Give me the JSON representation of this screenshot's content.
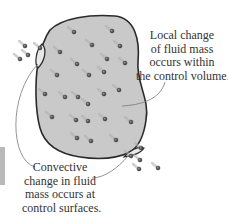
{
  "diagram": {
    "labels": {
      "local": [
        "Local change",
        "of fluid mass",
        "occurs within",
        "the control volume."
      ],
      "convective": [
        "Convective",
        "change in fluid",
        "mass occurs at",
        "control surfaces."
      ]
    },
    "colors": {
      "region_fill": "#c9c9c9",
      "outline": "#2a2a2a",
      "particle": "#555555",
      "leader_line": "#777777",
      "text": "#333333"
    },
    "particles": [
      [
        74,
        32
      ],
      [
        112,
        31
      ],
      [
        92,
        45
      ],
      [
        120,
        46
      ],
      [
        60,
        52
      ],
      [
        107,
        59
      ],
      [
        125,
        63
      ],
      [
        77,
        64
      ],
      [
        89,
        75
      ],
      [
        104,
        72
      ],
      [
        57,
        75
      ],
      [
        45,
        94
      ],
      [
        65,
        97
      ],
      [
        78,
        97
      ],
      [
        104,
        94
      ],
      [
        119,
        90
      ],
      [
        88,
        104
      ],
      [
        52,
        117
      ],
      [
        76,
        120
      ],
      [
        88,
        121
      ],
      [
        105,
        119
      ],
      [
        131,
        122
      ],
      [
        77,
        138
      ],
      [
        91,
        141
      ],
      [
        116,
        140
      ]
    ],
    "inflow_particles": [
      [
        25,
        46
      ],
      [
        28,
        55
      ],
      [
        20,
        59
      ],
      [
        40,
        48
      ]
    ],
    "outflow_particles": [
      [
        141,
        148
      ],
      [
        131,
        156
      ],
      [
        140,
        160
      ],
      [
        139,
        169
      ],
      [
        158,
        168
      ]
    ]
  }
}
